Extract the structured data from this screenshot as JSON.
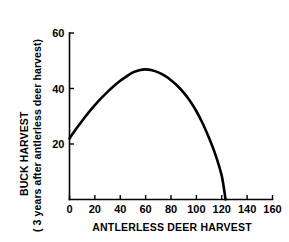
{
  "chart_data": {
    "type": "line",
    "title": "",
    "subtitle": "",
    "xlabel": "ANTLERLESS DEER HARVEST",
    "ylabel": "BUCK HARVEST",
    "ylabel_line2": "( 3 years after antlerless deer harvest)",
    "xlim": [
      0,
      160
    ],
    "ylim": [
      0,
      60
    ],
    "xticks": [
      0,
      20,
      40,
      60,
      80,
      100,
      120,
      140,
      160
    ],
    "xticklabels": [
      "0",
      "20",
      "40",
      "60",
      "80",
      "100",
      "120",
      "140",
      "160"
    ],
    "yticks": [
      20,
      40,
      60
    ],
    "yticklabels": [
      "20",
      "40",
      "60"
    ],
    "grid": false,
    "legend": false,
    "legend_position": "none",
    "line_color": "#000000",
    "background_color": "#ffffff",
    "series": [
      {
        "name": "Buck harvest response curve",
        "x": [
          0,
          5,
          10,
          15,
          20,
          25,
          30,
          35,
          40,
          45,
          50,
          55,
          60,
          65,
          70,
          75,
          80,
          85,
          90,
          95,
          100,
          105,
          110,
          115,
          120,
          123
        ],
        "y": [
          22.0,
          25.3,
          28.4,
          31.3,
          34.0,
          36.5,
          38.8,
          40.9,
          42.8,
          44.4,
          45.8,
          46.6,
          46.9,
          46.6,
          45.8,
          44.6,
          43.0,
          41.0,
          38.5,
          35.5,
          31.8,
          27.4,
          22.2,
          16.2,
          8.5,
          0.0
        ]
      }
    ],
    "annotations": [
      {
        "text": "peak of curve near x = 58, y = 47"
      },
      {
        "text": "curve intercepts y-axis at about y = 22"
      },
      {
        "text": "curve reaches zero at about x = 123"
      }
    ]
  }
}
